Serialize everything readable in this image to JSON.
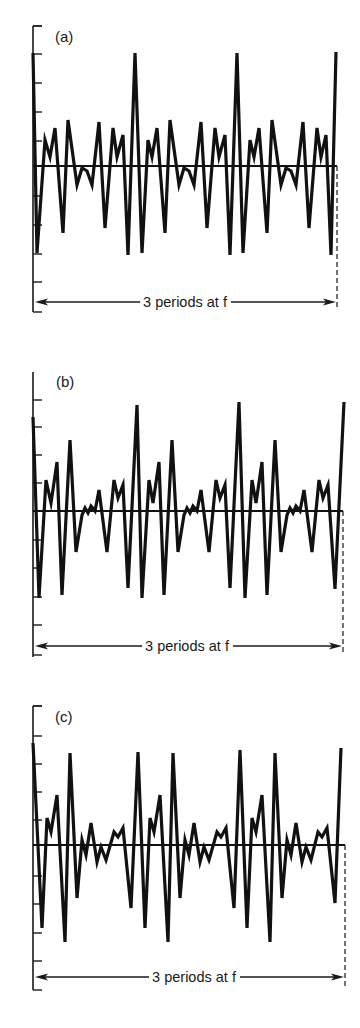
{
  "chart_data": [
    {
      "type": "line",
      "title": "(a)",
      "annotation": "3 periods at f",
      "xlabel": "",
      "ylabel": "",
      "grid": false,
      "axis": {
        "x": 33,
        "top": 26,
        "bottom": 312,
        "cap_top": true,
        "ticks": [
          26,
          54,
          83,
          112,
          141,
          196,
          225,
          254,
          282,
          312
        ]
      },
      "baseline_y": 166,
      "x_end": 337,
      "arrow_y": 302,
      "label_pos": [
        55,
        42
      ],
      "points": [
        [
          33,
          53
        ],
        [
          37,
          253
        ],
        [
          45,
          140
        ],
        [
          50,
          157
        ],
        [
          55,
          128
        ],
        [
          63,
          233
        ],
        [
          68,
          120
        ],
        [
          77,
          185
        ],
        [
          82,
          168
        ],
        [
          87,
          171
        ],
        [
          92,
          185
        ],
        [
          99,
          122
        ],
        [
          105,
          228
        ],
        [
          113,
          128
        ],
        [
          117,
          157
        ],
        [
          123,
          135
        ],
        [
          128,
          255
        ],
        [
          135,
          53
        ],
        [
          142,
          253
        ],
        [
          148,
          140
        ],
        [
          152,
          157
        ],
        [
          157,
          128
        ],
        [
          165,
          233
        ],
        [
          170,
          120
        ],
        [
          179,
          185
        ],
        [
          184,
          168
        ],
        [
          189,
          171
        ],
        [
          194,
          185
        ],
        [
          201,
          122
        ],
        [
          207,
          228
        ],
        [
          215,
          128
        ],
        [
          219,
          157
        ],
        [
          225,
          135
        ],
        [
          230,
          255
        ],
        [
          237,
          53
        ],
        [
          243,
          253
        ],
        [
          250,
          140
        ],
        [
          254,
          157
        ],
        [
          259,
          128
        ],
        [
          267,
          233
        ],
        [
          272,
          120
        ],
        [
          281,
          185
        ],
        [
          286,
          168
        ],
        [
          291,
          171
        ],
        [
          296,
          185
        ],
        [
          303,
          122
        ],
        [
          309,
          228
        ],
        [
          317,
          128
        ],
        [
          321,
          157
        ],
        [
          326,
          135
        ],
        [
          331,
          255
        ],
        [
          336,
          52
        ]
      ]
    },
    {
      "type": "line",
      "title": "(b)",
      "annotation": "3 periods at f",
      "xlabel": "",
      "ylabel": "",
      "grid": false,
      "axis": {
        "x": 33,
        "top": 372,
        "bottom": 657,
        "cap_top": false,
        "ticks": [
          400,
          427,
          455,
          483,
          540,
          568,
          597,
          625,
          655
        ]
      },
      "baseline_y": 511,
      "x_end": 343,
      "arrow_y": 646,
      "label_pos": [
        56,
        387
      ],
      "points": [
        [
          33,
          417
        ],
        [
          39,
          598
        ],
        [
          46,
          480
        ],
        [
          51,
          503
        ],
        [
          57,
          462
        ],
        [
          62,
          595
        ],
        [
          70,
          440
        ],
        [
          76,
          552
        ],
        [
          82,
          515
        ],
        [
          85,
          508
        ],
        [
          88,
          513
        ],
        [
          91,
          506
        ],
        [
          95,
          511
        ],
        [
          99,
          490
        ],
        [
          107,
          552
        ],
        [
          114,
          480
        ],
        [
          118,
          498
        ],
        [
          123,
          485
        ],
        [
          128,
          588
        ],
        [
          137,
          405
        ],
        [
          142,
          598
        ],
        [
          149,
          480
        ],
        [
          153,
          503
        ],
        [
          159,
          462
        ],
        [
          164,
          595
        ],
        [
          172,
          440
        ],
        [
          178,
          552
        ],
        [
          184,
          515
        ],
        [
          187,
          508
        ],
        [
          190,
          513
        ],
        [
          193,
          506
        ],
        [
          197,
          511
        ],
        [
          201,
          490
        ],
        [
          209,
          552
        ],
        [
          216,
          480
        ],
        [
          220,
          498
        ],
        [
          225,
          485
        ],
        [
          230,
          588
        ],
        [
          239,
          402
        ],
        [
          245,
          598
        ],
        [
          252,
          480
        ],
        [
          256,
          503
        ],
        [
          262,
          462
        ],
        [
          267,
          595
        ],
        [
          275,
          440
        ],
        [
          281,
          552
        ],
        [
          287,
          515
        ],
        [
          290,
          508
        ],
        [
          293,
          513
        ],
        [
          296,
          506
        ],
        [
          300,
          511
        ],
        [
          304,
          490
        ],
        [
          312,
          552
        ],
        [
          319,
          480
        ],
        [
          323,
          498
        ],
        [
          328,
          485
        ],
        [
          335,
          589
        ],
        [
          344,
          402
        ]
      ]
    },
    {
      "type": "line",
      "title": "(c)",
      "annotation": "3 periods at f",
      "xlabel": "",
      "ylabel": "",
      "grid": false,
      "axis": {
        "x": 33,
        "top": 706,
        "bottom": 990,
        "cap_top": true,
        "ticks": [
          706,
          736,
          764,
          792,
          820,
          876,
          904,
          933,
          961,
          990
        ]
      },
      "baseline_y": 845,
      "x_end": 345,
      "arrow_y": 977,
      "label_pos": [
        55,
        722
      ],
      "points": [
        [
          33,
          743
        ],
        [
          42,
          928
        ],
        [
          47,
          818
        ],
        [
          51,
          832
        ],
        [
          57,
          795
        ],
        [
          65,
          942
        ],
        [
          70,
          753
        ],
        [
          77,
          898
        ],
        [
          82,
          840
        ],
        [
          86,
          855
        ],
        [
          91,
          823
        ],
        [
          97,
          862
        ],
        [
          101,
          847
        ],
        [
          106,
          860
        ],
        [
          114,
          832
        ],
        [
          118,
          837
        ],
        [
          123,
          828
        ],
        [
          131,
          908
        ],
        [
          138,
          752
        ],
        [
          145,
          928
        ],
        [
          150,
          818
        ],
        [
          154,
          832
        ],
        [
          160,
          795
        ],
        [
          168,
          942
        ],
        [
          173,
          753
        ],
        [
          180,
          898
        ],
        [
          185,
          840
        ],
        [
          189,
          855
        ],
        [
          194,
          823
        ],
        [
          200,
          862
        ],
        [
          204,
          847
        ],
        [
          209,
          860
        ],
        [
          217,
          832
        ],
        [
          221,
          837
        ],
        [
          226,
          828
        ],
        [
          234,
          908
        ],
        [
          240,
          750
        ],
        [
          247,
          928
        ],
        [
          252,
          818
        ],
        [
          256,
          832
        ],
        [
          262,
          795
        ],
        [
          270,
          942
        ],
        [
          275,
          753
        ],
        [
          282,
          898
        ],
        [
          287,
          840
        ],
        [
          291,
          855
        ],
        [
          296,
          823
        ],
        [
          302,
          862
        ],
        [
          306,
          847
        ],
        [
          311,
          860
        ],
        [
          318,
          832
        ],
        [
          322,
          837
        ],
        [
          327,
          828
        ],
        [
          335,
          903
        ],
        [
          341,
          748
        ]
      ]
    }
  ],
  "panels": [
    {
      "label": "(a)",
      "span_text": "3 periods at f"
    },
    {
      "label": "(b)",
      "span_text": "3 periods at f"
    },
    {
      "label": "(c)",
      "span_text": "3 periods at f"
    }
  ]
}
